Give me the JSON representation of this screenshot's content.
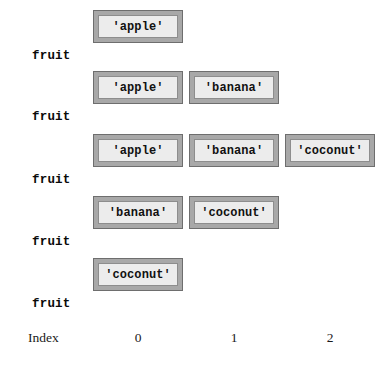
{
  "figure": {
    "index_axis_label": "Index",
    "index_ticks": [
      "0",
      "1",
      "2"
    ],
    "cell_width_px": 90,
    "cell_gap_px": 6,
    "first_cell_left_px": 93,
    "colors": {
      "cell_outer_fill": "#a8a8a8",
      "cell_outer_border": "#6e6e6e",
      "cell_inner_fill": "#ececec",
      "cell_inner_border": "#8d8d8d",
      "page_background": "#ffffff",
      "text": "#111111"
    }
  },
  "rows": [
    {
      "variable": "fruit",
      "top_px": 10,
      "cells": [
        {
          "value": "'apple'",
          "index": 0
        }
      ],
      "captions": [
        {
          "text": "front/rear",
          "index": 0
        }
      ]
    },
    {
      "variable": "fruit",
      "top_px": 71,
      "cells": [
        {
          "value": "'apple'",
          "index": 0
        },
        {
          "value": "'banana'",
          "index": 1
        }
      ],
      "captions": [
        {
          "text": "front",
          "index": 0
        },
        {
          "text": "rear",
          "index": 1
        }
      ]
    },
    {
      "variable": "fruit",
      "top_px": 134,
      "cells": [
        {
          "value": "'apple'",
          "index": 0
        },
        {
          "value": "'banana'",
          "index": 1
        },
        {
          "value": "'coconut'",
          "index": 2
        }
      ],
      "captions": [
        {
          "text": "front",
          "index": 0
        },
        {
          "text": "rear",
          "index": 2
        }
      ]
    },
    {
      "variable": "fruit",
      "top_px": 196,
      "cells": [
        {
          "value": "'banana'",
          "index": 0
        },
        {
          "value": "'coconut'",
          "index": 1
        }
      ],
      "captions": [
        {
          "text": "front",
          "index": 0
        },
        {
          "text": "rear",
          "index": 1
        }
      ]
    },
    {
      "variable": "fruit",
      "top_px": 258,
      "cells": [
        {
          "value": "'coconut'",
          "index": 0
        }
      ],
      "captions": [
        {
          "text": "front/rear",
          "index": 0
        }
      ]
    }
  ]
}
